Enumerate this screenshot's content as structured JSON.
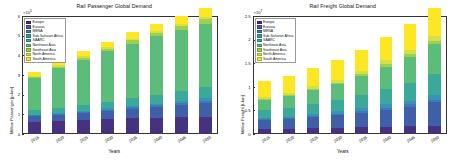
{
  "chart_data": [
    {
      "type": "bar",
      "stacked": true,
      "panel": "left",
      "title": "Rail Passenger Global Demand",
      "xlabel": "Years",
      "ylabel": "Million Passenger [p-km]",
      "y_exponent": "×10",
      "y_exponent_power": "5",
      "ylim": [
        0,
        6
      ],
      "yticks": [
        0,
        1,
        2,
        3,
        4,
        5,
        6
      ],
      "ytick_labels": [
        "0",
        "1",
        "2",
        "3",
        "4",
        "5",
        "6"
      ],
      "grid": false,
      "legend_position": "upper-left",
      "categories": [
        "2015",
        "2020",
        "2025",
        "2030",
        "2035",
        "2040",
        "2045",
        "2050"
      ],
      "series": [
        {
          "name": "Europe",
          "color": "#46327e",
          "values": [
            0.62,
            0.66,
            0.7,
            0.75,
            0.79,
            0.82,
            0.85,
            0.88
          ]
        },
        {
          "name": "Eurasia",
          "color": "#3f5fa9",
          "values": [
            0.3,
            0.33,
            0.37,
            0.42,
            0.48,
            0.55,
            0.62,
            0.7
          ]
        },
        {
          "name": "MENA",
          "color": "#3b79b8",
          "values": [
            0.04,
            0.05,
            0.06,
            0.07,
            0.08,
            0.09,
            0.1,
            0.11
          ]
        },
        {
          "name": "Sub-Saharan Africa",
          "color": "#3a93b6",
          "values": [
            0.03,
            0.04,
            0.05,
            0.06,
            0.07,
            0.09,
            0.1,
            0.12
          ]
        },
        {
          "name": "SAARC",
          "color": "#3aa99a",
          "values": [
            0.22,
            0.26,
            0.3,
            0.35,
            0.4,
            0.46,
            0.52,
            0.58
          ]
        },
        {
          "name": "Northeast Asia",
          "color": "#5cbd7a",
          "values": [
            1.62,
            2.0,
            2.3,
            2.56,
            2.78,
            2.96,
            3.1,
            3.2
          ]
        },
        {
          "name": "Southeast Asia",
          "color": "#9dd04f",
          "values": [
            0.07,
            0.09,
            0.11,
            0.13,
            0.16,
            0.19,
            0.22,
            0.25
          ]
        },
        {
          "name": "North America",
          "color": "#d4e04a",
          "values": [
            0.05,
            0.06,
            0.07,
            0.08,
            0.09,
            0.1,
            0.11,
            0.12
          ]
        },
        {
          "name": "South America",
          "color": "#fde725",
          "values": [
            0.2,
            0.22,
            0.25,
            0.28,
            0.32,
            0.36,
            0.4,
            0.44
          ]
        }
      ]
    },
    {
      "type": "bar",
      "stacked": true,
      "panel": "right",
      "title": "Rail Freight Global Demand",
      "xlabel": "Years",
      "ylabel": "Million Freight [t-km]",
      "y_exponent": "×10",
      "y_exponent_power": "7",
      "ylim": [
        0,
        2.5
      ],
      "yticks": [
        0,
        0.5,
        1,
        1.5,
        2,
        2.5
      ],
      "ytick_labels": [
        "0",
        "0.5",
        "1",
        "1.5",
        "2",
        "2.5"
      ],
      "grid": false,
      "legend_position": "upper-left",
      "categories": [
        "2015",
        "2020",
        "2025",
        "2030",
        "2035",
        "2040",
        "2045",
        "2050"
      ],
      "series": [
        {
          "name": "Europe",
          "color": "#46327e",
          "values": [
            0.1,
            0.11,
            0.12,
            0.13,
            0.14,
            0.15,
            0.16,
            0.17
          ]
        },
        {
          "name": "Eurasia",
          "color": "#3f5fa9",
          "values": [
            0.19,
            0.21,
            0.24,
            0.27,
            0.31,
            0.36,
            0.42,
            0.5
          ]
        },
        {
          "name": "MENA",
          "color": "#3b79b8",
          "values": [
            0.02,
            0.02,
            0.03,
            0.03,
            0.04,
            0.05,
            0.05,
            0.06
          ]
        },
        {
          "name": "Sub-Saharan Africa",
          "color": "#3a93b6",
          "values": [
            0.03,
            0.03,
            0.04,
            0.05,
            0.06,
            0.07,
            0.08,
            0.1
          ]
        },
        {
          "name": "SAARC",
          "color": "#3aa99a",
          "values": [
            0.16,
            0.18,
            0.21,
            0.24,
            0.28,
            0.33,
            0.38,
            0.44
          ]
        },
        {
          "name": "Northeast Asia",
          "color": "#5cbd7a",
          "values": [
            0.22,
            0.25,
            0.29,
            0.34,
            0.4,
            0.47,
            0.55,
            0.64
          ]
        },
        {
          "name": "Southeast Asia",
          "color": "#9dd04f",
          "values": [
            0.02,
            0.02,
            0.03,
            0.03,
            0.04,
            0.05,
            0.06,
            0.07
          ]
        },
        {
          "name": "North America",
          "color": "#d4e04a",
          "values": [
            0.05,
            0.05,
            0.06,
            0.06,
            0.07,
            0.08,
            0.09,
            0.1
          ]
        },
        {
          "name": "South America",
          "color": "#fde725",
          "values": [
            0.33,
            0.35,
            0.38,
            0.41,
            0.45,
            0.49,
            0.54,
            0.59
          ]
        }
      ]
    }
  ]
}
